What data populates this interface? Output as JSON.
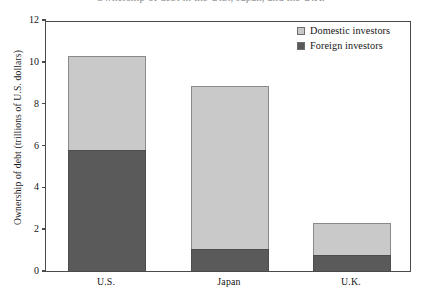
{
  "figure": {
    "title_remnant": "Ownership of debt in the U.S., Japan, and the U.K.",
    "background_color": "#ffffff"
  },
  "chart_data": {
    "type": "bar",
    "subtype": "stacked-bar",
    "title": "",
    "xlabel": "",
    "ylabel": "Ownership of debt (trillions of U.S. dollars)",
    "categories": [
      "U.S.",
      "Japan",
      "U.K."
    ],
    "series": [
      {
        "name": "Foreign investors",
        "color": "#5a5a5a",
        "values": [
          5.8,
          1.05,
          0.75
        ]
      },
      {
        "name": "Domestic investors",
        "color": "#c9c9c9",
        "values": [
          4.5,
          7.8,
          1.55
        ]
      }
    ],
    "totals": [
      10.3,
      8.85,
      2.3
    ],
    "stack_order": [
      "Foreign investors",
      "Domestic investors"
    ],
    "ylim": [
      0,
      12
    ],
    "yticks": [
      "0",
      "2",
      "4",
      "6",
      "8",
      "10",
      "12"
    ],
    "ytick_values": [
      0,
      2,
      4,
      6,
      8,
      10,
      12
    ],
    "grid": false,
    "legend_position": "top-right",
    "legend": [
      {
        "label": "Domestic investors",
        "color": "#c9c9c9"
      },
      {
        "label": "Foreign investors",
        "color": "#5a5a5a"
      }
    ]
  }
}
